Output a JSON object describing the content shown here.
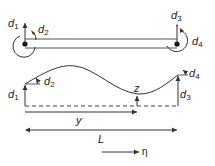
{
  "diagram": {
    "type": "beam-element-degrees-of-freedom",
    "stroke_color": "#333333",
    "top_beam": {
      "labels": {
        "d1": {
          "base": "d",
          "sub": "1"
        },
        "d2": {
          "base": "d",
          "sub": "2"
        },
        "d3": {
          "base": "d",
          "sub": "3"
        },
        "d4": {
          "base": "d",
          "sub": "4"
        }
      },
      "nodes": [
        "left-node",
        "right-node"
      ]
    },
    "deflected_shape": {
      "labels": {
        "d1": {
          "base": "d",
          "sub": "1"
        },
        "d2": {
          "base": "d",
          "sub": "2"
        },
        "d3": {
          "base": "d",
          "sub": "3"
        },
        "d4": {
          "base": "d",
          "sub": "4"
        },
        "z": "z"
      }
    },
    "dimensions": {
      "y_label": "y",
      "L_label": "L",
      "eta_label": "η"
    }
  }
}
